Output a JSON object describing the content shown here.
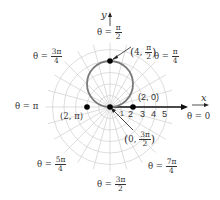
{
  "diagram": {
    "type": "polar-graph",
    "curve": "r = 4 sin θ",
    "axes": {
      "x_label": "x",
      "y_label": "y"
    },
    "radial_ticks": [
      "1",
      "2",
      "3",
      "4",
      "5"
    ],
    "angle_labels": [
      {
        "id": "pi_over_2",
        "theta": "θ =",
        "num": "π",
        "den": "2"
      },
      {
        "id": "pi_over_4",
        "theta": "θ =",
        "num": "π",
        "den": "4"
      },
      {
        "id": "three_pi_over_4",
        "theta": "θ =",
        "num": "3π",
        "den": "4"
      },
      {
        "id": "pi",
        "text": "θ = π"
      },
      {
        "id": "zero",
        "text": "θ = 0"
      },
      {
        "id": "five_pi_over_4",
        "theta": "θ =",
        "num": "5π",
        "den": "4"
      },
      {
        "id": "three_pi_over_2",
        "theta": "θ =",
        "num": "3π",
        "den": "2"
      },
      {
        "id": "seven_pi_over_4",
        "theta": "θ =",
        "num": "7π",
        "den": "4"
      }
    ],
    "points": [
      {
        "id": "p1",
        "r": "4",
        "theta_num": "π",
        "theta_den": "2"
      },
      {
        "id": "p2",
        "label": "(2, 0)"
      },
      {
        "id": "p3",
        "label": "(2, π)"
      },
      {
        "id": "p4",
        "r": "0",
        "theta_num": "3π",
        "theta_den": "2"
      }
    ],
    "colors": {
      "grid": "#c8c8c8",
      "curve": "#7a7a7a",
      "axis": "#111111",
      "point": "#000000"
    }
  }
}
